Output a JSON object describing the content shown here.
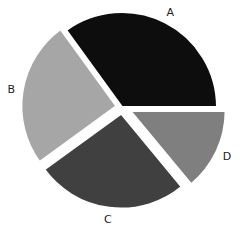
{
  "chart_data": {
    "type": "pie",
    "title": "",
    "categories": [
      "A",
      "B",
      "C",
      "D"
    ],
    "values": [
      35,
      25,
      26,
      14
    ],
    "colors": [
      "#0d0d0d",
      "#a6a6a6",
      "#404040",
      "#7f7f7f"
    ],
    "explode": [
      0,
      0.06,
      0.07,
      0.1
    ],
    "start_angle_deg": 0,
    "direction": "counterclockwise",
    "legend": "none",
    "labels_outside": true
  }
}
